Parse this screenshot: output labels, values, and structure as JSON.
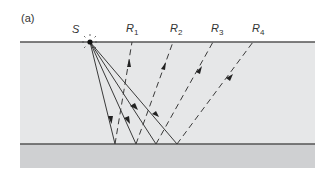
{
  "figure": {
    "panel_label": "(a)",
    "source_label": "S",
    "receivers": [
      {
        "label": "R",
        "sub": "1",
        "x": 132
      },
      {
        "label": "R",
        "sub": "2",
        "x": 173
      },
      {
        "label": "R",
        "sub": "3",
        "x": 213
      },
      {
        "label": "R",
        "sub": "4",
        "x": 253
      }
    ],
    "source_x": 90,
    "surface_y": 42,
    "reflector_y": 144,
    "reflection_points_x": [
      115,
      136,
      156,
      177
    ],
    "colors": {
      "upper_layer": "#e6e7e8",
      "lower_layer": "#cfd0d2",
      "lines": "#3a3a3a",
      "interface": "#555555"
    }
  }
}
